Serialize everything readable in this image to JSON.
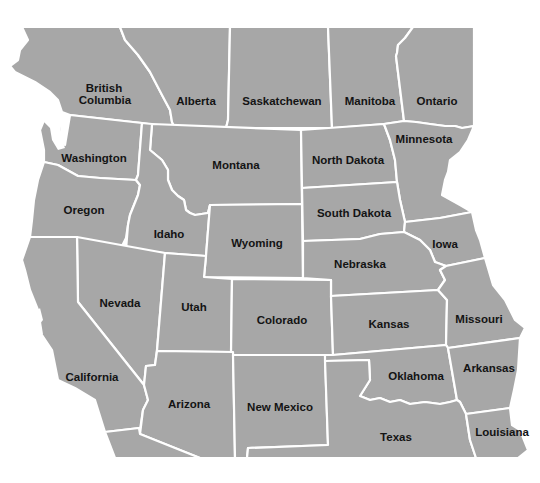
{
  "map": {
    "land_color": "#a7a7a7",
    "border_color": "#ffffff",
    "background_color": "#ffffff",
    "label_color": "#141414",
    "regions": [
      {
        "id": "british-columbia",
        "label_lines": [
          "British",
          "Columbia"
        ],
        "country": "Canada"
      },
      {
        "id": "alberta",
        "label_lines": [
          "Alberta"
        ],
        "country": "Canada"
      },
      {
        "id": "saskatchewan",
        "label_lines": [
          "Saskatchewan"
        ],
        "country": "Canada"
      },
      {
        "id": "manitoba",
        "label_lines": [
          "Manitoba"
        ],
        "country": "Canada"
      },
      {
        "id": "ontario",
        "label_lines": [
          "Ontario"
        ],
        "country": "Canada"
      },
      {
        "id": "washington",
        "label_lines": [
          "Washington"
        ],
        "country": "USA"
      },
      {
        "id": "montana",
        "label_lines": [
          "Montana"
        ],
        "country": "USA"
      },
      {
        "id": "north-dakota",
        "label_lines": [
          "North Dakota"
        ],
        "country": "USA"
      },
      {
        "id": "minnesota",
        "label_lines": [
          "Minnesota"
        ],
        "country": "USA"
      },
      {
        "id": "oregon",
        "label_lines": [
          "Oregon"
        ],
        "country": "USA"
      },
      {
        "id": "idaho",
        "label_lines": [
          "Idaho"
        ],
        "country": "USA"
      },
      {
        "id": "wyoming",
        "label_lines": [
          "Wyoming"
        ],
        "country": "USA"
      },
      {
        "id": "south-dakota",
        "label_lines": [
          "South Dakota"
        ],
        "country": "USA"
      },
      {
        "id": "iowa",
        "label_lines": [
          "Iowa"
        ],
        "country": "USA"
      },
      {
        "id": "nebraska",
        "label_lines": [
          "Nebraska"
        ],
        "country": "USA"
      },
      {
        "id": "nevada",
        "label_lines": [
          "Nevada"
        ],
        "country": "USA"
      },
      {
        "id": "utah",
        "label_lines": [
          "Utah"
        ],
        "country": "USA"
      },
      {
        "id": "colorado",
        "label_lines": [
          "Colorado"
        ],
        "country": "USA"
      },
      {
        "id": "kansas",
        "label_lines": [
          "Kansas"
        ],
        "country": "USA"
      },
      {
        "id": "missouri",
        "label_lines": [
          "Missouri"
        ],
        "country": "USA"
      },
      {
        "id": "california",
        "label_lines": [
          "California"
        ],
        "country": "USA"
      },
      {
        "id": "arizona",
        "label_lines": [
          "Arizona"
        ],
        "country": "USA"
      },
      {
        "id": "new-mexico",
        "label_lines": [
          "New Mexico"
        ],
        "country": "USA"
      },
      {
        "id": "oklahoma",
        "label_lines": [
          "Oklahoma"
        ],
        "country": "USA"
      },
      {
        "id": "arkansas",
        "label_lines": [
          "Arkansas"
        ],
        "country": "USA"
      },
      {
        "id": "texas",
        "label_lines": [
          "Texas"
        ],
        "country": "USA"
      },
      {
        "id": "louisiana",
        "label_lines": [
          "Louisiana"
        ],
        "country": "USA"
      }
    ]
  }
}
